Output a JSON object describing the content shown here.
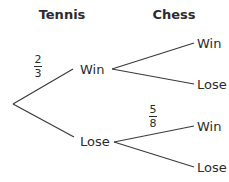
{
  "headers": {
    "stage1": "Tennis",
    "stage2": "Chess"
  },
  "nodes": {
    "tennis_win": "Win",
    "tennis_lose": "Lose",
    "chess_after_win_win": "Win",
    "chess_after_win_lose": "Lose",
    "chess_after_lose_win": "Win",
    "chess_after_lose_lose": "Lose"
  },
  "probabilities": {
    "tennis_win": {
      "numerator": "2",
      "denominator": "3"
    },
    "chess_after_lose_win": {
      "numerator": "5",
      "denominator": "8"
    }
  },
  "colors": {
    "line": "#3a3a3a",
    "text": "#2b2b2b",
    "background": "#ffffff"
  }
}
